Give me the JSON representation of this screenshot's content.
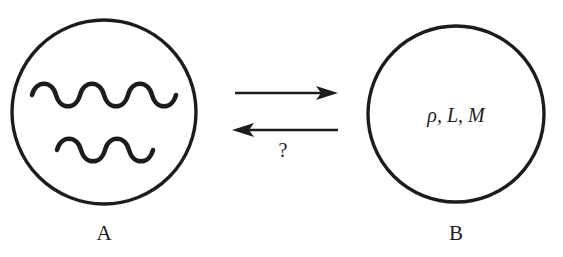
{
  "diagram": {
    "type": "two-node-exchange-diagram",
    "background_color": "#ffffff",
    "ink_color": "#1c1c1c",
    "nodes": [
      {
        "id": "A",
        "label": "A",
        "label_position": "below",
        "center": {
          "x": 104,
          "y": 112
        },
        "radius": 92,
        "contents_kind": "wavy-lines",
        "contents_text": "",
        "wave_count": 2
      },
      {
        "id": "B",
        "label": "B",
        "label_position": "below",
        "center": {
          "x": 456,
          "y": 114
        },
        "radius": 88,
        "contents_kind": "text",
        "contents_text": "ρ, L, M",
        "contents_symbols": [
          "ρ",
          "L",
          "M"
        ],
        "wave_count": 0
      }
    ],
    "arrows": [
      {
        "id": "forward-arrow",
        "direction": "right",
        "from_node": "A",
        "to_node": "B",
        "label": "",
        "x_start": 235,
        "x_end": 338,
        "y": 93
      },
      {
        "id": "reverse-arrow",
        "direction": "left",
        "from_node": "B",
        "to_node": "A",
        "label": "?",
        "label_position": "below",
        "x_start": 338,
        "x_end": 233,
        "y": 130
      }
    ],
    "annotations": [
      {
        "id": "question-mark",
        "text": "?",
        "x": 283,
        "y": 156
      }
    ]
  }
}
